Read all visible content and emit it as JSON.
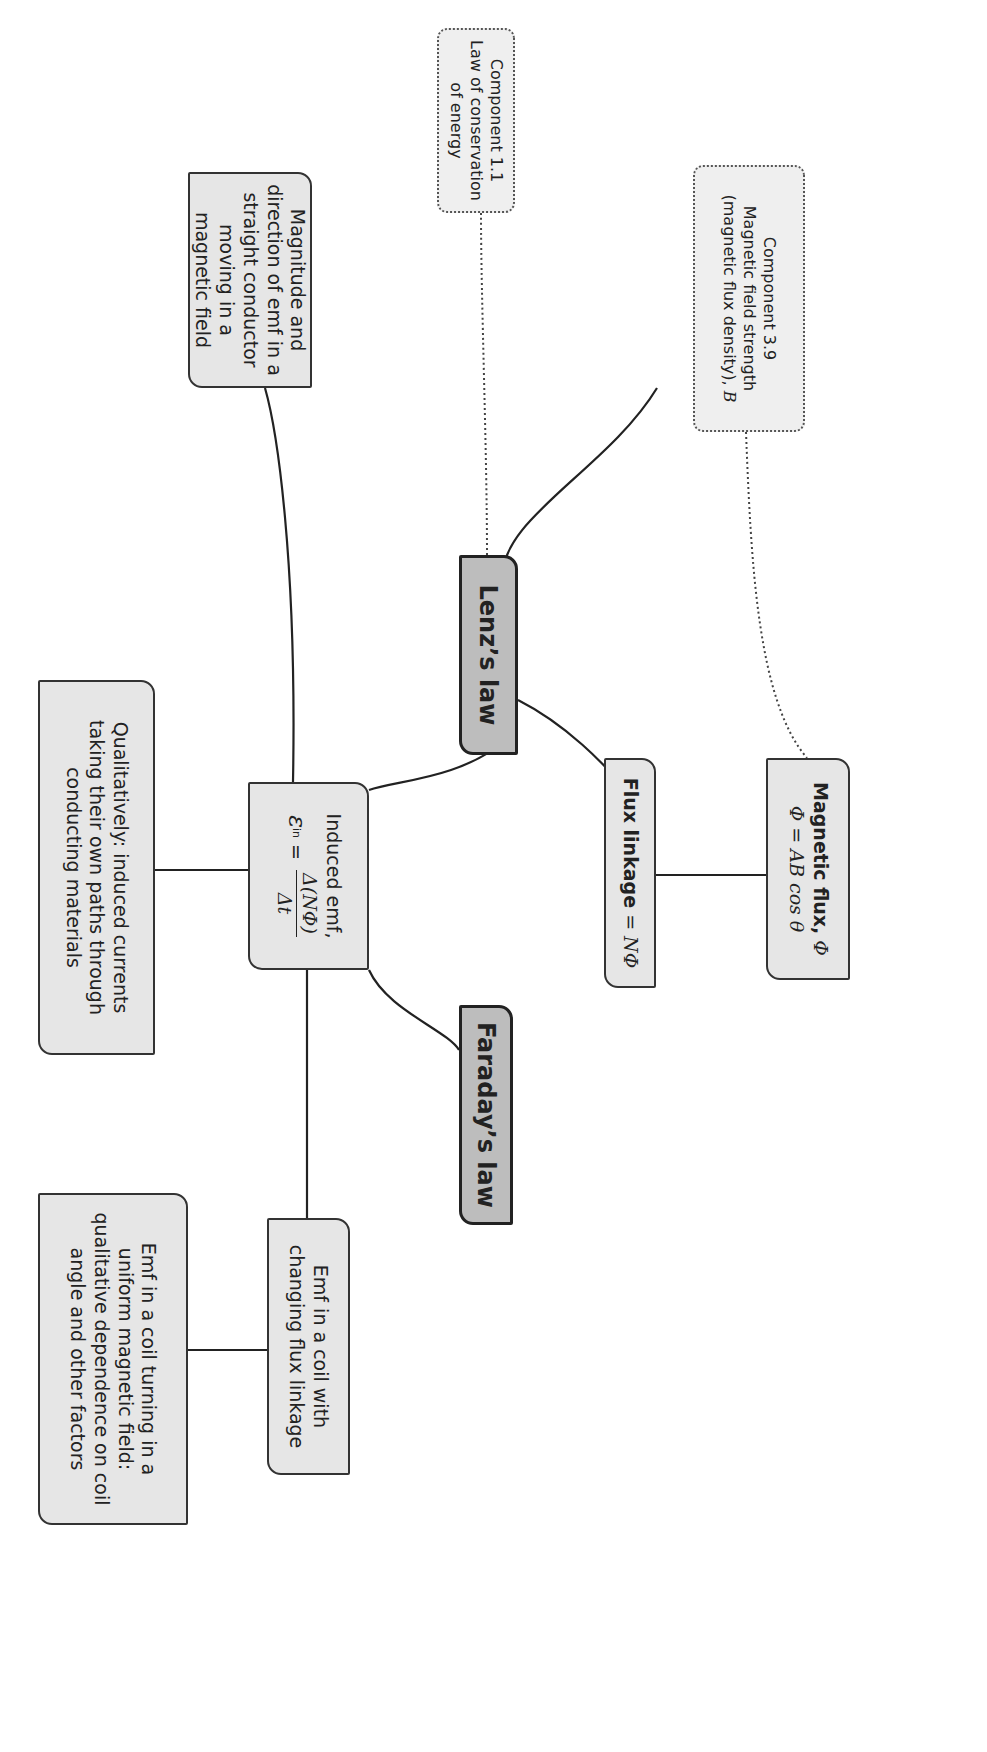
{
  "diagram": {
    "orientation": "rotated 90 degrees clockwise",
    "nodes": {
      "component_1_1": {
        "title": "Component 1.1",
        "text": "Law of conservation of energy"
      },
      "component_3_9": {
        "title": "Component 3.9",
        "line2": "Magnetic field strength",
        "line3": "(magnetic flux density),",
        "symbol": "B"
      },
      "magnitude": {
        "text": "Magnitude and direction of emf in a straight conductor moving in a magnetic field"
      },
      "lenz": {
        "label": "Lenz’s law"
      },
      "faraday": {
        "label": "Faraday’s law"
      },
      "flux_linkage": {
        "bold": "Flux linkage",
        "rest": " = NΦ"
      },
      "magnetic_flux": {
        "bold": "Magnetic flux,",
        "symbol": " Φ",
        "formula": "Φ = AB cos θ"
      },
      "induced_emf": {
        "title": "Induced emf,",
        "lhs": "ε",
        "lhs_sub": "in",
        "eq": " = ",
        "numerator": "Δ(NΦ)",
        "denominator": "Δt"
      },
      "qualitatively": {
        "text": "Qualitatively: induced currents taking their own paths through conducting materials"
      },
      "emf_changing": {
        "text": "Emf in a coil with changing flux linkage"
      },
      "emf_turning": {
        "text": "Emf in a coil turning in a uniform magnetic field: qualitative dependence on coil angle and other factors"
      }
    },
    "colors": {
      "key_fill": "#bdbdbd",
      "box_fill": "#e6e6e6",
      "ref_fill": "#efefef",
      "stroke": "#222222"
    }
  }
}
